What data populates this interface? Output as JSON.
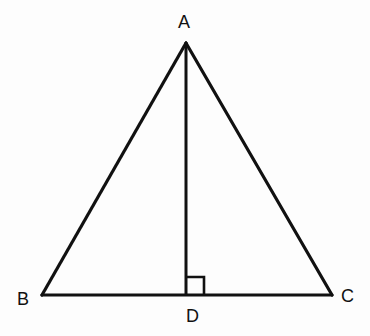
{
  "diagram": {
    "type": "isosceles-triangle-with-altitude",
    "stroke_color": "#111111",
    "background_color": "#fdfdfd",
    "vertices": {
      "A": {
        "label": "A",
        "x": 186,
        "y": 43
      },
      "B": {
        "label": "B",
        "x": 42,
        "y": 295
      },
      "C": {
        "label": "C",
        "x": 332,
        "y": 295
      },
      "D": {
        "label": "D",
        "x": 186,
        "y": 295
      }
    },
    "segments": [
      {
        "from": "A",
        "to": "B",
        "name": "side-AB"
      },
      {
        "from": "A",
        "to": "C",
        "name": "side-AC"
      },
      {
        "from": "B",
        "to": "C",
        "name": "base-BC"
      },
      {
        "from": "A",
        "to": "D",
        "name": "altitude-AD"
      }
    ],
    "right_angle_marker": {
      "at": "D",
      "size": 18
    }
  }
}
